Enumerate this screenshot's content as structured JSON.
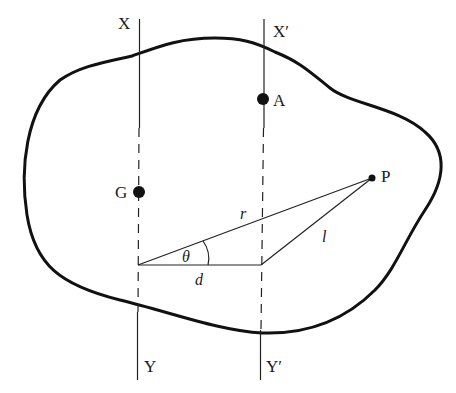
{
  "diagram": {
    "type": "parallel-axis-theorem",
    "axes": [
      {
        "id": "XY",
        "top_label": "X",
        "bottom_label": "Y"
      },
      {
        "id": "X'Y'",
        "top_label": "X′",
        "bottom_label": "Y′"
      }
    ],
    "points": [
      {
        "id": "A",
        "label": "A"
      },
      {
        "id": "G",
        "label": "G"
      },
      {
        "id": "P",
        "label": "P"
      }
    ],
    "segments": [
      {
        "id": "r",
        "label": "r"
      },
      {
        "id": "l",
        "label": "l"
      },
      {
        "id": "d",
        "label": "d"
      }
    ],
    "angle": {
      "label": "θ"
    }
  }
}
